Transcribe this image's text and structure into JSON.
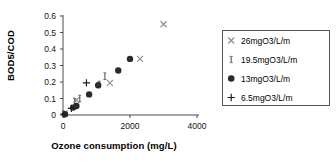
{
  "chart_data": {
    "type": "scatter",
    "title": "",
    "xlabel": "Ozone consumption  (mg/L)",
    "ylabel": "BOD5/COD",
    "xlim": [
      0,
      4000
    ],
    "ylim": [
      0,
      0.6
    ],
    "xticks": [
      "0",
      "2000",
      "4000"
    ],
    "xtick_values": [
      0,
      2000,
      4000
    ],
    "yticks": [
      "0",
      "0.1",
      "0.2",
      "0.3",
      "0.4",
      "0.5",
      "0.6"
    ],
    "ytick_values": [
      0,
      0.1,
      0.2,
      0.3,
      0.4,
      0.5,
      0.6
    ],
    "grid": false,
    "legend_position": "right",
    "series": [
      {
        "name": "26mgO3/L/m",
        "marker": "x-cross",
        "color": "#8a8a8a",
        "points": [
          [
            50,
            0.01
          ],
          [
            400,
            0.09
          ],
          [
            1400,
            0.195
          ],
          [
            2300,
            0.34
          ],
          [
            3000,
            0.55
          ]
        ]
      },
      {
        "name": "19.5mgO3/L/m",
        "marker": "vertical-bar",
        "color": "#6f6f6f",
        "points": [
          [
            350,
            0.08
          ],
          [
            500,
            0.1
          ],
          [
            1080,
            0.185
          ],
          [
            1250,
            0.235
          ]
        ]
      },
      {
        "name": "13mgO3/L/m",
        "marker": "filled-circle",
        "color": "#2b2b2b",
        "points": [
          [
            60,
            0.005
          ],
          [
            300,
            0.045
          ],
          [
            400,
            0.055
          ],
          [
            780,
            0.125
          ],
          [
            1050,
            0.18
          ],
          [
            1650,
            0.27
          ],
          [
            2000,
            0.34
          ]
        ]
      },
      {
        "name": "6.5mgO3/L/m",
        "marker": "plus",
        "color": "#1f1f1f",
        "points": [
          [
            30,
            0.005
          ],
          [
            250,
            0.04
          ],
          [
            700,
            0.195
          ]
        ]
      }
    ]
  },
  "legend": {
    "entries": [
      {
        "label": "26mgO3/L/m"
      },
      {
        "label": "19.5mgO3/L/m"
      },
      {
        "label": "13mgO3/L/m"
      },
      {
        "label": "6.5mgO3/L/m"
      }
    ]
  },
  "colors": {
    "axis": "#4a4a4a",
    "text": "#000000",
    "legend_border": "#555555",
    "background": "#ffffff"
  }
}
